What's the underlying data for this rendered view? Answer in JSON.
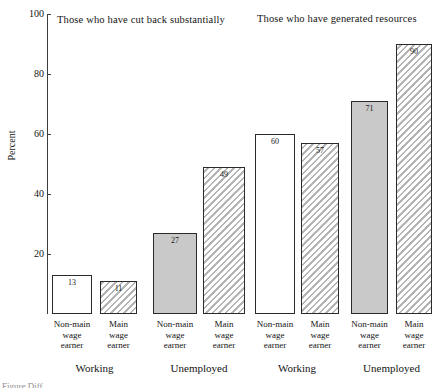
{
  "chart_data": {
    "type": "bar",
    "title": "",
    "panels": [
      {
        "title": "Those who have cut back substantially",
        "groups": [
          {
            "label": "Working",
            "bars": [
              {
                "category": "Non-main wage earner",
                "value": 13,
                "label": "13",
                "fill": "open"
              },
              {
                "category": "Main wage earner",
                "value": 11,
                "label": "11",
                "fill": "hatch-open"
              }
            ]
          },
          {
            "label": "Unemployed",
            "bars": [
              {
                "category": "Non-main wage earner",
                "value": 27,
                "label": "27",
                "fill": "solid"
              },
              {
                "category": "Main wage earner",
                "value": 49,
                "label": "49",
                "fill": "hatch-gray"
              }
            ]
          }
        ]
      },
      {
        "title": "Those who have generated resources",
        "groups": [
          {
            "label": "Working",
            "bars": [
              {
                "category": "Non-main wage earner",
                "value": 60,
                "label": "60",
                "fill": "open"
              },
              {
                "category": "Main wage earner",
                "value": 57,
                "label": "57",
                "fill": "hatch-open"
              }
            ]
          },
          {
            "label": "Unemployed",
            "bars": [
              {
                "category": "Non-main wage earner",
                "value": 71,
                "label": "71",
                "fill": "solid"
              },
              {
                "category": "Main wage earner",
                "value": 90,
                "label": "90",
                "fill": "hatch-gray"
              }
            ]
          }
        ]
      }
    ],
    "categories": [
      "Non-main wage earner",
      "Main wage earner",
      "Non-main wage earner",
      "Main wage earner",
      "Non-main wage earner",
      "Main wage earner",
      "Non-main wage earner",
      "Main wage earner"
    ],
    "values": [
      13,
      11,
      27,
      49,
      60,
      57,
      71,
      90
    ],
    "xlabel": "",
    "ylabel": "Percent",
    "ylim": [
      0,
      100
    ],
    "yticks": [
      0,
      20,
      40,
      60,
      80,
      100
    ],
    "ytick_labels": [
      "",
      "20",
      "40",
      "60",
      "80",
      "100"
    ],
    "grid": false,
    "legend": "none",
    "colors": {
      "open": "#ffffff",
      "solid": "#c9c9c9",
      "hatch": "#b4b4b4",
      "outline": "#2a2a2a",
      "axis": "#3c3c3c",
      "text": "#141414"
    }
  },
  "axis": {
    "ylabel": "Percent",
    "ticks": [
      {
        "value": 100,
        "label": "100"
      },
      {
        "value": 80,
        "label": "80"
      },
      {
        "value": 60,
        "label": "60"
      },
      {
        "value": 40,
        "label": "40"
      },
      {
        "value": 20,
        "label": "20"
      }
    ]
  },
  "panel_titles": {
    "left": "Those who have cut back substantially",
    "right": "Those who have generated resources"
  },
  "category_labels": [
    {
      "line1": "Non-main",
      "line2": "wage",
      "line3": "earner"
    },
    {
      "line1": "Main",
      "line2": "wage",
      "line3": "earner"
    },
    {
      "line1": "Non-main",
      "line2": "wage",
      "line3": "earner"
    },
    {
      "line1": "Main",
      "line2": "wage",
      "line3": "earner"
    },
    {
      "line1": "Non-main",
      "line2": "wage",
      "line3": "earner"
    },
    {
      "line1": "Main",
      "line2": "wage",
      "line3": "earner"
    },
    {
      "line1": "Non-main",
      "line2": "wage",
      "line3": "earner"
    },
    {
      "line1": "Main",
      "line2": "wage",
      "line3": "earner"
    }
  ],
  "group_labels": [
    "Working",
    "Unemployed",
    "Working",
    "Unemployed"
  ],
  "caption": "Figure    Diff"
}
